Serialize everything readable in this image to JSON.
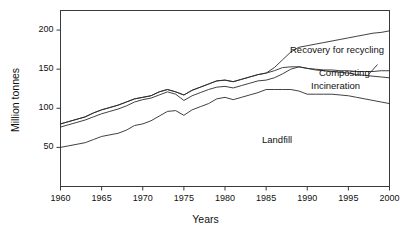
{
  "figure": {
    "name": "municipal-solid-waste-management-line-chart"
  },
  "axes": {
    "x": {
      "title": "Years",
      "ticks": [
        1960,
        1965,
        1970,
        1975,
        1980,
        1985,
        1990,
        1995,
        2000
      ],
      "tick_labels": [
        "1960",
        "1965",
        "1970",
        "1975",
        "1980",
        "1985",
        "1990",
        "1995",
        "2000"
      ],
      "min": 1960,
      "max": 2000
    },
    "y": {
      "title": "Million tonnes",
      "ticks": [
        50,
        100,
        150,
        200
      ],
      "tick_labels": [
        "50",
        "100",
        "150",
        "200"
      ],
      "min": 0,
      "max": 225
    }
  },
  "series_labels": {
    "recovery": "Recovery for recycling",
    "composting": "Composting",
    "incineration": "Incineration",
    "landfill": "Landfill"
  },
  "style": {
    "line_color": "#2b2b2b",
    "frame_color": "#3a3a3a",
    "text_color": "#111111",
    "background": "#ffffff"
  },
  "chart_data": {
    "type": "line",
    "title": "",
    "subtitle": "",
    "xlabel": "Years",
    "ylabel": "Million tonnes",
    "xlim": [
      1960,
      2000
    ],
    "ylim": [
      0,
      225
    ],
    "grid": false,
    "legend": "inline-annotations",
    "note": "Cumulative boundary lines: Landfill is the lowest band; successive lines add Incineration, Composting and Recovery for recycling. The topmost line is total waste generated.",
    "x": [
      1960,
      1961,
      1962,
      1963,
      1964,
      1965,
      1966,
      1967,
      1968,
      1969,
      1970,
      1971,
      1972,
      1973,
      1974,
      1975,
      1976,
      1977,
      1978,
      1979,
      1980,
      1981,
      1982,
      1983,
      1984,
      1985,
      1986,
      1987,
      1988,
      1989,
      1990,
      1991,
      1992,
      1993,
      1994,
      1995,
      1996,
      1997,
      1998,
      1999,
      2000
    ],
    "series": [
      {
        "name": "Landfill",
        "label": "Landfill",
        "values": [
          50,
          52,
          54,
          56,
          60,
          64,
          66,
          68,
          72,
          78,
          80,
          84,
          90,
          96,
          97,
          91,
          98,
          102,
          106,
          112,
          114,
          111,
          114,
          117,
          120,
          124,
          124,
          124,
          124,
          122,
          118,
          118,
          118,
          118,
          117,
          116,
          114,
          112,
          110,
          108,
          106
        ]
      },
      {
        "name": "Landfill + Incineration",
        "label": "Incineration",
        "values": [
          76,
          79,
          82,
          85,
          89,
          93,
          96,
          99,
          103,
          108,
          111,
          113,
          117,
          121,
          118,
          110,
          116,
          120,
          124,
          127,
          128,
          126,
          129,
          132,
          135,
          136,
          139,
          144,
          150,
          153,
          151,
          149,
          148,
          147,
          146,
          145,
          143,
          142,
          141,
          140,
          139
        ]
      },
      {
        "name": "Landfill + Incineration + Composting",
        "label": "Composting",
        "values": [
          80,
          83,
          86,
          89,
          94,
          98,
          101,
          104,
          108,
          112,
          114,
          116,
          121,
          124,
          121,
          117,
          123,
          127,
          131,
          135,
          136,
          134,
          137,
          140,
          143,
          145,
          148,
          152,
          153,
          153,
          151,
          150,
          149,
          149,
          148,
          148,
          147,
          147,
          147,
          148,
          148
        ]
      },
      {
        "name": "Total (incl. Recovery for recycling)",
        "label": "Recovery for recycling",
        "values": [
          80,
          83,
          86,
          89,
          94,
          98,
          101,
          104,
          108,
          112,
          114,
          116,
          121,
          124,
          121,
          117,
          123,
          127,
          131,
          135,
          136,
          134,
          137,
          140,
          143,
          145,
          152,
          162,
          172,
          178,
          180,
          182,
          184,
          186,
          188,
          190,
          192,
          194,
          196,
          197,
          199
        ]
      }
    ]
  }
}
